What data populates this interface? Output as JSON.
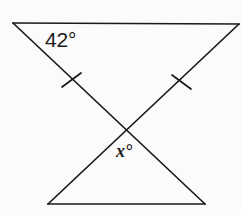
{
  "figure": {
    "type": "geometry-diagram",
    "background_color": "#fbfbfb",
    "stroke_color": "#1a1a1a",
    "stroke_width": 1.6,
    "width": 241,
    "height": 215
  },
  "labels": {
    "top_angle": "42°",
    "bottom_angle": "x°"
  },
  "points": {
    "top_left": {
      "x": 13,
      "y": 23
    },
    "top_right": {
      "x": 239,
      "y": 24
    },
    "bottom_left": {
      "x": 48,
      "y": 204
    },
    "bottom_right": {
      "x": 205,
      "y": 204
    },
    "intersection": {
      "x": 127,
      "y": 132
    }
  },
  "segments": [
    {
      "name": "top-side",
      "x1": 13,
      "y1": 23,
      "x2": 239,
      "y2": 24
    },
    {
      "name": "bottom-side",
      "x1": 48,
      "y1": 204,
      "x2": 205,
      "y2": 204
    },
    {
      "name": "diagonal-topleft-to-bottomright",
      "x1": 13,
      "y1": 23,
      "x2": 205,
      "y2": 204
    },
    {
      "name": "diagonal-topright-to-bottomleft",
      "x1": 239,
      "y1": 24,
      "x2": 48,
      "y2": 204
    }
  ],
  "tick_marks": [
    {
      "name": "congruence-tick-left",
      "cx": 71,
      "cy": 80,
      "x1": 62,
      "y1": 86,
      "x2": 80,
      "y2": 74
    },
    {
      "name": "congruence-tick-right",
      "cx": 181,
      "cy": 82,
      "x1": 172,
      "y1": 76,
      "x2": 190,
      "y2": 88
    }
  ]
}
